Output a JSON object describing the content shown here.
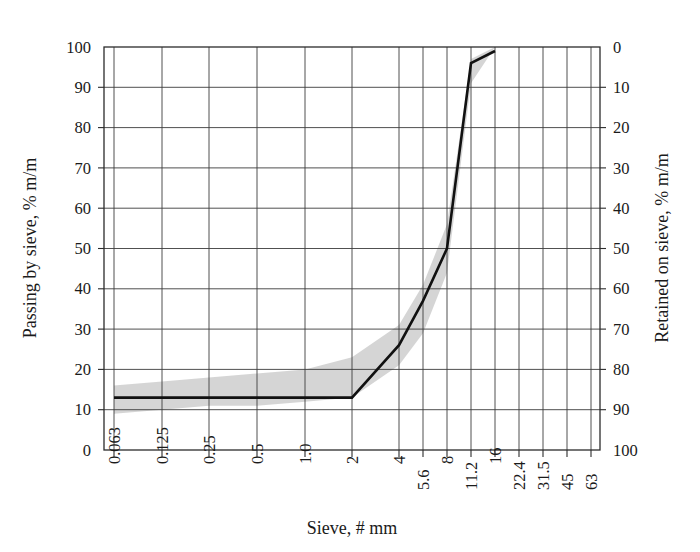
{
  "chart_data": {
    "type": "line",
    "title": "",
    "xlabel": "Sieve, # mm",
    "ylabel": "Passing by sieve, % m/m",
    "y2label": "Retained on sieve, % m/m",
    "grid": true,
    "legend": "none",
    "x_scale": "sieve-ordinal",
    "x_tick_labels": [
      "0.063",
      "0.125",
      "0.25",
      "0.5",
      "1.0",
      "2",
      "4",
      "5.6",
      "8",
      "11.2",
      "16",
      "22.4",
      "31.5",
      "45",
      "63"
    ],
    "x_tick_positions": [
      114,
      162,
      209,
      257,
      305,
      352,
      399,
      423,
      447,
      471,
      495,
      519,
      543,
      567,
      591
    ],
    "x_tick_label_rows": [
      0,
      0,
      0,
      0,
      0,
      0,
      0,
      1,
      0,
      1,
      0,
      1,
      1,
      1,
      1
    ],
    "y_tick_labels": [
      "0",
      "10",
      "20",
      "30",
      "40",
      "50",
      "60",
      "70",
      "80",
      "90",
      "100"
    ],
    "ylim": [
      0,
      100
    ],
    "y2_tick_labels": [
      "0",
      "10",
      "20",
      "30",
      "40",
      "50",
      "60",
      "70",
      "80",
      "90",
      "100"
    ],
    "y2lim": [
      100,
      0
    ],
    "y2_inverted": true,
    "series": [
      {
        "name": "Grading curve",
        "color": "#111111",
        "x": [
          "0.063",
          "0.125",
          "0.25",
          "0.5",
          "1.0",
          "2",
          "4",
          "5.6",
          "8",
          "11.2",
          "16"
        ],
        "values": [
          13,
          13,
          13,
          13,
          13,
          13,
          26,
          37,
          50,
          96,
          99
        ]
      },
      {
        "name": "Envelope upper bound",
        "color": "#d3d3d3",
        "x": [
          "0.063",
          "0.125",
          "0.25",
          "0.5",
          "1.0",
          "2",
          "4",
          "5.6",
          "8",
          "11.2",
          "16"
        ],
        "values": [
          16,
          17,
          18,
          19,
          20,
          23,
          31,
          41,
          56,
          97,
          100
        ]
      },
      {
        "name": "Envelope lower bound",
        "color": "#d3d3d3",
        "x": [
          "0.063",
          "0.125",
          "0.25",
          "0.5",
          "1.0",
          "2",
          "4",
          "5.6",
          "8",
          "11.2",
          "16"
        ],
        "values": [
          9,
          10,
          11,
          11,
          12,
          13,
          21,
          29,
          44,
          91,
          100
        ]
      }
    ],
    "annotations": []
  },
  "axes": {
    "left_title": "Passing by sieve, % m/m",
    "right_title": "Retained on sieve, % m/m",
    "bottom_title": "Sieve, # mm"
  },
  "colors": {
    "curve": "#111111",
    "band": "#d3d3d3",
    "grid": "#3c3c3c",
    "frame": "#2b2b2b",
    "background": "#ffffff"
  }
}
